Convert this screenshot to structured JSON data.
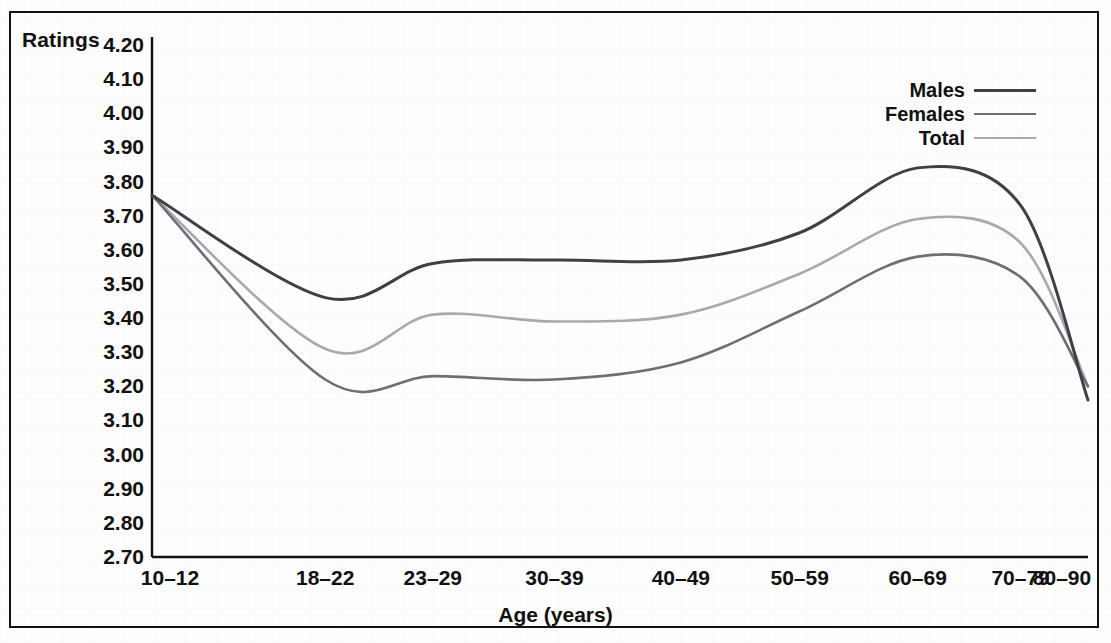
{
  "chart_data": {
    "type": "line",
    "title": "",
    "xlabel": "Age (years)",
    "ylabel": "Ratings",
    "categories": [
      "10–12",
      "18–22",
      "23–29",
      "30–39",
      "40–49",
      "50–59",
      "60–69",
      "70–79",
      "80–90"
    ],
    "ylim": [
      2.7,
      4.2
    ],
    "yticks": [
      "4.20",
      "4.10",
      "4.00",
      "3.90",
      "3.80",
      "3.70",
      "3.60",
      "3.50",
      "3.40",
      "3.30",
      "3.20",
      "3.10",
      "3.00",
      "2.90",
      "2.80",
      "2.70"
    ],
    "ytick_values": [
      4.2,
      4.1,
      4.0,
      3.9,
      3.8,
      3.7,
      3.6,
      3.5,
      3.4,
      3.3,
      3.2,
      3.1,
      3.0,
      2.9,
      2.8,
      2.7
    ],
    "grid": false,
    "legend_position": "top-right",
    "series": [
      {
        "name": "Males",
        "color": "#3f3f46",
        "values": [
          3.76,
          3.46,
          3.56,
          3.57,
          3.57,
          3.65,
          3.84,
          3.73,
          3.16
        ]
      },
      {
        "name": "Females",
        "color": "#6e6e78",
        "values": [
          3.76,
          3.22,
          3.23,
          3.22,
          3.27,
          3.42,
          3.58,
          3.52,
          3.2
        ]
      },
      {
        "name": "Total",
        "color": "#a8a8b0",
        "values": [
          3.76,
          3.31,
          3.41,
          3.39,
          3.41,
          3.53,
          3.69,
          3.62,
          3.2
        ]
      }
    ]
  },
  "legend": {
    "entries": [
      {
        "label": "Males",
        "color": "#3f3f46",
        "width": 3.0
      },
      {
        "label": "Females",
        "color": "#6e6e78",
        "width": 2.6
      },
      {
        "label": "Total",
        "color": "#a8a8b0",
        "width": 2.6
      }
    ]
  },
  "axes": {
    "y_title": "Ratings",
    "x_title": "Age (years)",
    "axis_color": "#111111"
  }
}
